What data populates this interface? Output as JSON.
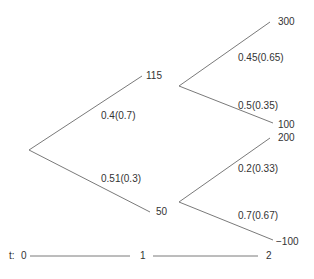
{
  "tree": {
    "root": {
      "id": "root"
    },
    "t1_nodes": [
      {
        "value": "115"
      },
      {
        "value": "50"
      }
    ],
    "t2_nodes": [
      {
        "value": "300"
      },
      {
        "value": "100"
      },
      {
        "value": "200"
      },
      {
        "value": "−100"
      }
    ],
    "edges": [
      {
        "label": "0.4(0.7)"
      },
      {
        "label": "0.51(0.3)"
      },
      {
        "label": "0.45(0.65)"
      },
      {
        "label": "0.5(0.35)"
      },
      {
        "label": "0.2(0.33)"
      },
      {
        "label": "0.7(0.67)"
      }
    ]
  },
  "timeline": {
    "prefix": "t:",
    "ticks": [
      "0",
      "1",
      "2"
    ]
  },
  "colors": {
    "line": "#7a7a7a",
    "text": "#333333"
  }
}
